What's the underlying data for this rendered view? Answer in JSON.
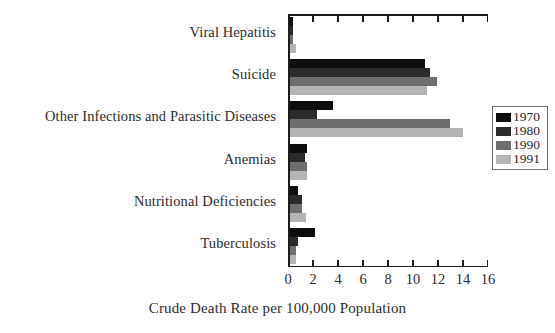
{
  "chart_data": {
    "type": "bar",
    "orientation": "horizontal",
    "title": "",
    "xlabel": "Crude Death Rate per 100,000 Population",
    "ylabel": "",
    "xlim": [
      0,
      16
    ],
    "xticks": [
      0,
      2,
      4,
      6,
      8,
      10,
      12,
      14,
      16
    ],
    "xtick_labels": [
      "0",
      "2",
      "4",
      "6",
      "8",
      "10",
      "12",
      "14",
      "16"
    ],
    "grid": false,
    "legend_position": "right",
    "categories": [
      "Viral Hepatitis",
      "Suicide",
      "Other Infections and Parasitic Diseases",
      "Anemias",
      "Nutritional Deficiencies",
      "Tuberculosis"
    ],
    "series": [
      {
        "name": "1970",
        "color": "#0d0d0d",
        "values": [
          0.3,
          10.8,
          3.5,
          1.4,
          0.7,
          2.0
        ]
      },
      {
        "name": "1980",
        "color": "#2b2b2b",
        "values": [
          0.3,
          11.2,
          2.2,
          1.2,
          1.0,
          0.7
        ]
      },
      {
        "name": "1990",
        "color": "#6e6e6e",
        "values": [
          0.3,
          11.8,
          12.8,
          1.4,
          1.0,
          0.5
        ]
      },
      {
        "name": "1991",
        "color": "#b4b4b4",
        "values": [
          0.5,
          11.0,
          13.9,
          1.4,
          1.3,
          0.5
        ]
      }
    ]
  },
  "legend": {
    "entries": [
      {
        "label": "1970",
        "color": "#0d0d0d"
      },
      {
        "label": "1980",
        "color": "#2b2b2b"
      },
      {
        "label": "1990",
        "color": "#6e6e6e"
      },
      {
        "label": "1991",
        "color": "#b4b4b4"
      }
    ]
  },
  "axis": {
    "x_title": "Crude Death Rate per 100,000 Population"
  }
}
